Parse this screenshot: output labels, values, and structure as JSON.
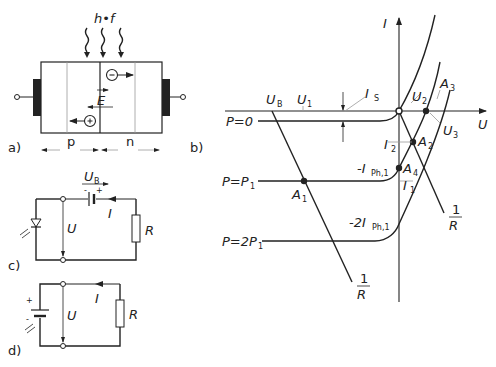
{
  "panels": {
    "a": {
      "label": "a)",
      "photon": "h•f",
      "field": "E",
      "electron": "−",
      "hole": "+",
      "p_region": "p",
      "n_region": "n"
    },
    "b": {
      "label": "b)",
      "axis_x": "U",
      "axis_y": "I",
      "U_B": "U",
      "U_B_sub": "B",
      "U_1": "U",
      "U_1_sub": "1",
      "U_2": "U",
      "U_2_sub": "2",
      "U_3": "U",
      "U_3_sub": "3",
      "I_S": "I",
      "I_S_sub": "S",
      "I_1": "I",
      "I_1_sub": "1",
      "I_2": "I",
      "I_2_sub": "2",
      "I_Ph1": "-I",
      "I_Ph1_sub": "Ph,1",
      "I_2Ph1": "-2I",
      "I_2Ph1_sub": "Ph,1",
      "curve_P0": "P=0",
      "curve_P1": "P=P",
      "curve_P1_sub": "1",
      "curve_2P1": "P=2P",
      "curve_2P1_sub": "1",
      "A1": "A",
      "A1_sub": "1",
      "A2": "A",
      "A2_sub": "2",
      "A3": "A",
      "A3_sub": "3",
      "A4": "A",
      "A4_sub": "4",
      "load_num": "1",
      "load_den": "R"
    },
    "c": {
      "label": "c)",
      "U_B": "U",
      "U_B_sub": "B",
      "current": "I",
      "voltage": "U",
      "resistor": "R",
      "minus": "-",
      "plus": "+"
    },
    "d": {
      "label": "d)",
      "current": "I",
      "voltage": "U",
      "resistor": "R",
      "minus": "-",
      "plus": "+"
    }
  }
}
